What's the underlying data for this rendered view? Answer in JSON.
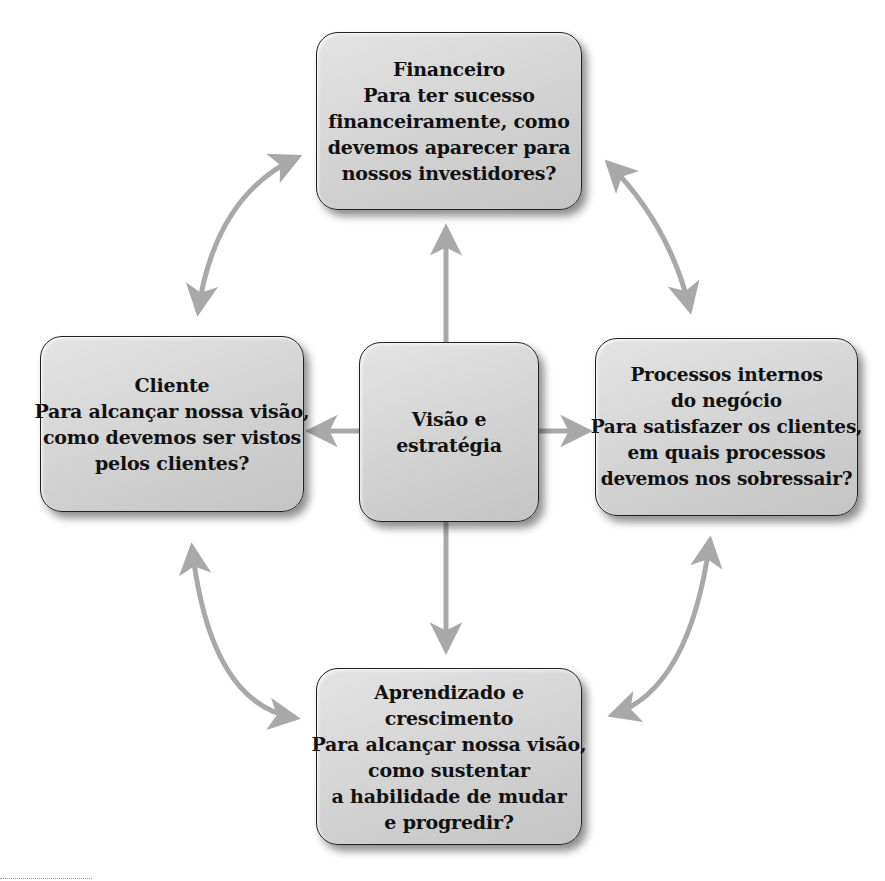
{
  "diagram": {
    "type": "balanced-scorecard",
    "colors": {
      "box_fill": "#d4d4d4",
      "box_border": "#222222",
      "arrow": "#a8a8a8",
      "text": "#111111",
      "background": "#ffffff"
    },
    "center": {
      "lines": [
        "Visão e",
        "estratégia"
      ]
    },
    "perspectives": {
      "top": {
        "title": "Financeiro",
        "lines": [
          "Financeiro",
          "Para ter sucesso",
          "financeiramente, como",
          "devemos aparecer para",
          "nossos investidores?"
        ]
      },
      "left": {
        "title": "Cliente",
        "lines": [
          "Cliente",
          "Para alcançar nossa visão,",
          "como devemos ser vistos",
          "pelos clientes?"
        ]
      },
      "right": {
        "title": "Processos internos do negócio",
        "lines": [
          "Processos internos",
          "do negócio",
          "Para satisfazer os clientes,",
          "em quais processos",
          "devemos nos sobressair?"
        ]
      },
      "bottom": {
        "title": "Aprendizado e crescimento",
        "lines": [
          "Aprendizado e",
          "crescimento",
          "Para alcançar nossa visão,",
          "como sustentar",
          "a habilidade de mudar",
          "e progredir?"
        ]
      }
    },
    "connections": [
      {
        "from": "center",
        "to": "top",
        "style": "straight-arrow"
      },
      {
        "from": "center",
        "to": "left",
        "style": "straight-arrow"
      },
      {
        "from": "center",
        "to": "right",
        "style": "straight-arrow"
      },
      {
        "from": "center",
        "to": "bottom",
        "style": "straight-arrow"
      },
      {
        "from": "top",
        "to": "left",
        "style": "curved-double-arrow"
      },
      {
        "from": "top",
        "to": "right",
        "style": "curved-double-arrow"
      },
      {
        "from": "left",
        "to": "bottom",
        "style": "curved-double-arrow"
      },
      {
        "from": "right",
        "to": "bottom",
        "style": "curved-double-arrow"
      }
    ]
  }
}
